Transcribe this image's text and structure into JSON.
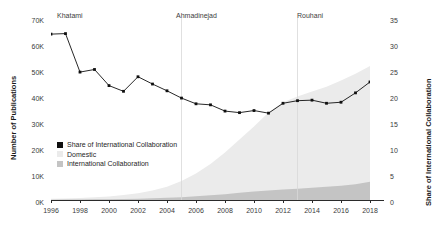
{
  "chart_data": {
    "type": "area",
    "title": "",
    "xlabel": "",
    "ylabel": "Number of Publications",
    "y2label": "Share of International Collaboration",
    "x": [
      1996,
      1997,
      1998,
      1999,
      2000,
      2001,
      2002,
      2003,
      2004,
      2005,
      2006,
      2007,
      2008,
      2009,
      2010,
      2011,
      2012,
      2013,
      2014,
      2015,
      2016,
      2017,
      2018
    ],
    "xlim": [
      1996,
      2018
    ],
    "ylim": [
      0,
      70000
    ],
    "y2lim": [
      0,
      35
    ],
    "xticks": [
      "1996",
      "1998",
      "2000",
      "2002",
      "2004",
      "2006",
      "2008",
      "2010",
      "2012",
      "2014",
      "2016",
      "2018"
    ],
    "yticks": [
      "0K",
      "10K",
      "20K",
      "30K",
      "40K",
      "50K",
      "60K",
      "70K"
    ],
    "y2ticks": [
      "0",
      "5",
      "10",
      "15",
      "20",
      "25",
      "30",
      "35"
    ],
    "grid": false,
    "legend_position": "center-left",
    "series": [
      {
        "name": "Share of International Collaboration",
        "type": "line",
        "axis": "right",
        "color": "#101010",
        "values": [
          31.9,
          32.0,
          24.6,
          25.1,
          22.0,
          20.9,
          23.7,
          22.3,
          21.0,
          19.6,
          18.5,
          18.3,
          17.1,
          16.8,
          17.2,
          16.7,
          18.6,
          19.1,
          19.2,
          18.6,
          18.8,
          20.6,
          22.7
        ]
      },
      {
        "name": "Domestic",
        "type": "area",
        "axis": "left",
        "color": "#ebebeb",
        "values": [
          300,
          420,
          560,
          760,
          1050,
          1500,
          2100,
          3000,
          4300,
          6200,
          8800,
          12000,
          16000,
          20500,
          25000,
          30000,
          33500,
          35500,
          37000,
          38500,
          40500,
          42500,
          44500
        ]
      },
      {
        "name": "International Collaboration",
        "type": "area",
        "axis": "left",
        "color": "#c4c4c4",
        "values": [
          140,
          190,
          230,
          280,
          330,
          400,
          500,
          640,
          830,
          1080,
          1400,
          1800,
          2250,
          2750,
          3250,
          3700,
          4050,
          4350,
          4700,
          5050,
          5450,
          6100,
          7000
        ]
      }
    ],
    "annotations": [
      {
        "label": "Khatami",
        "x": 1997,
        "type": "period-label"
      },
      {
        "label": "Ahmadinejad",
        "x": 2005,
        "type": "period-label"
      },
      {
        "label": "Rouhani",
        "x": 2013,
        "type": "period-label"
      }
    ],
    "dividers": [
      2005,
      2013
    ]
  }
}
